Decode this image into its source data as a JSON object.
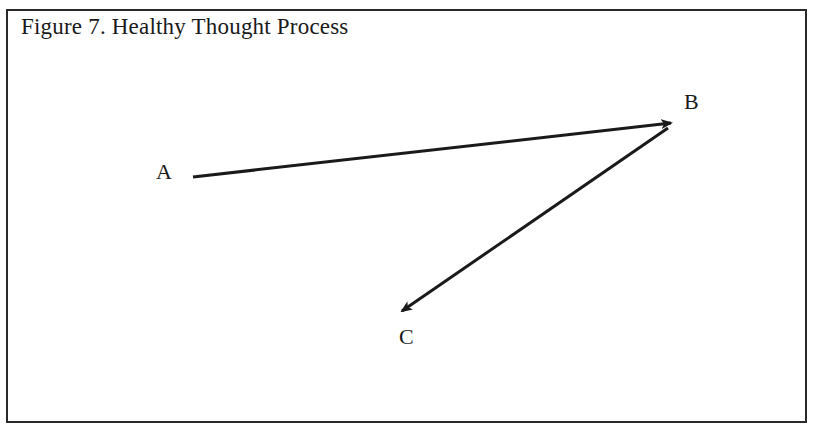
{
  "figure": {
    "title": "Figure 7. Healthy Thought Process"
  },
  "nodes": [
    {
      "id": "A",
      "label": "A",
      "x": 156,
      "y": 161
    },
    {
      "id": "B",
      "label": "B",
      "x": 684,
      "y": 91
    },
    {
      "id": "C",
      "label": "C",
      "x": 399,
      "y": 326
    }
  ],
  "edges": [
    {
      "from": "A",
      "to": "B",
      "x1": 193,
      "y1": 177,
      "x2": 671,
      "y2": 123
    },
    {
      "from": "B",
      "to": "C",
      "x1": 668,
      "y1": 128,
      "x2": 402,
      "y2": 311
    }
  ],
  "colors": {
    "stroke": "#1a1a1a",
    "frame": "#2a2a2a",
    "background": "#ffffff"
  }
}
